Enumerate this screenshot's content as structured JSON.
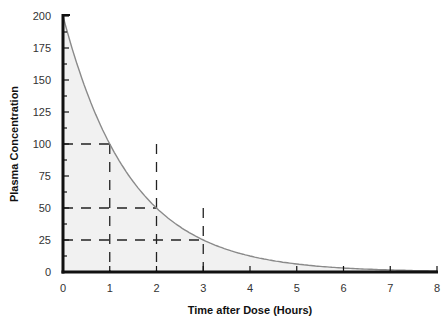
{
  "chart_data": {
    "type": "area",
    "title": "",
    "xlabel": "Time after Dose (Hours)",
    "ylabel": "Plasma Concentration",
    "xlim": [
      0,
      8
    ],
    "ylim": [
      0,
      200
    ],
    "x_ticks": [
      0,
      1,
      2,
      3,
      4,
      5,
      6,
      7,
      8
    ],
    "y_ticks": [
      0,
      25,
      50,
      75,
      100,
      125,
      150,
      175,
      200
    ],
    "y_minor_step": 12.5,
    "grid": false,
    "legend": null,
    "series": [
      {
        "name": "Plasma Concentration",
        "x": [
          0,
          1,
          2,
          3,
          4,
          5,
          6,
          7,
          8
        ],
        "values": [
          200,
          100,
          50,
          25,
          12.5,
          6.25,
          3.1,
          1.6,
          0.8
        ],
        "model": "exponential decay, half-life 1 hour (C = 200 * 0.5^t)",
        "color": "#8a8a8a",
        "fill": "#f1f1f1"
      }
    ],
    "annotations": [
      {
        "type": "dashed-guide",
        "horizontal_at": 100,
        "from_x": 0,
        "to_x": 1,
        "vertical_at": 1
      },
      {
        "type": "dashed-guide",
        "horizontal_at": 50,
        "from_x": 0,
        "to_x": 2,
        "vertical_at": 2
      },
      {
        "type": "dashed-guide",
        "horizontal_at": 25,
        "from_x": 0,
        "to_x": 3,
        "vertical_at": 3
      }
    ]
  },
  "colors": {
    "axis": "#111111",
    "curve": "#8a8a8a",
    "fill": "#f1f1f1",
    "guides": "#222222"
  }
}
